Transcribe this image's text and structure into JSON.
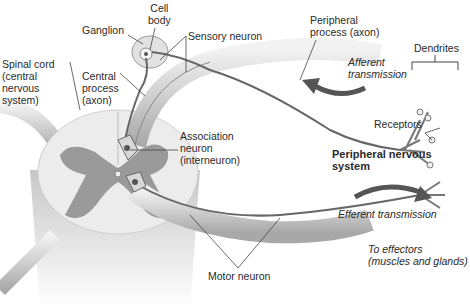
{
  "diagram": {
    "labels": {
      "cell_body": "Cell\nbody",
      "ganglion": "Ganglion",
      "sensory_neuron": "Sensory neuron",
      "peripheral_process": "Peripheral\nprocess (axon)",
      "spinal_cord": "Spinal cord\n(central\nnervous\nsystem)",
      "central_process": "Central\nprocess\n(axon)",
      "afferent": "Afferent\ntransmission",
      "dendrites": "Dendrites",
      "receptors": "Receptors",
      "association_neuron": "Association\nneuron\n(interneuron)",
      "pns": "Peripheral nervous system",
      "efferent": "Efferent transmission",
      "to_effectors": "To effectors\n(muscles and glands)",
      "motor_neuron": "Motor neuron"
    },
    "colors": {
      "gray_matter": "#9a9a9a",
      "white_matter": "#ececec",
      "nerve": "#d4d4d4",
      "arrow": "#555555",
      "leader_line": "#444444"
    }
  }
}
